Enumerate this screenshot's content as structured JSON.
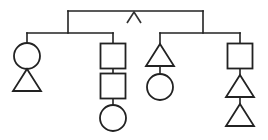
{
  "diagram": {
    "type": "pedigree-chart",
    "background_color": "#ffffff",
    "stroke_color": "#222222",
    "shape_fill": "#ffffff",
    "canvas": {
      "width": 268,
      "height": 140
    },
    "marker": {
      "name": "caret-mark",
      "glyph": "^",
      "x": 134,
      "y": 20,
      "description": "caret pointing up, hanging below top connector bar"
    },
    "connectors": [
      {
        "name": "top-sibling-bar",
        "type": "horizontal",
        "x1": 68,
        "x2": 203,
        "y": 11
      },
      {
        "name": "top-left-drop",
        "type": "vertical",
        "x": 68,
        "y1": 11,
        "y2": 33
      },
      {
        "name": "top-right-drop",
        "type": "vertical",
        "x": 203,
        "y1": 11,
        "y2": 33
      },
      {
        "name": "left-sibling-bar",
        "type": "horizontal",
        "x1": 27,
        "x2": 113,
        "y": 33
      },
      {
        "name": "left-branch-drop-a",
        "type": "vertical",
        "x": 27,
        "y1": 33,
        "y2": 43
      },
      {
        "name": "left-branch-drop-b",
        "type": "vertical",
        "x": 113,
        "y1": 33,
        "y2": 43
      },
      {
        "name": "right-sibling-bar",
        "type": "horizontal",
        "x1": 160,
        "x2": 240,
        "y": 33
      },
      {
        "name": "right-branch-drop-a",
        "type": "vertical",
        "x": 160,
        "y1": 33,
        "y2": 44
      },
      {
        "name": "right-branch-drop-b",
        "type": "vertical",
        "x": 240,
        "y1": 33,
        "y2": 43
      }
    ],
    "branches": [
      {
        "name": "branch-1",
        "center_x": 27,
        "nodes": [
          {
            "name": "circle-node",
            "shape": "circle",
            "cx": 27,
            "cy": 56,
            "r": 13
          },
          {
            "name": "triangle-node",
            "shape": "triangle",
            "cx": 27,
            "top_y": 69,
            "bottom_y": 91,
            "half_width": 14
          }
        ]
      },
      {
        "name": "branch-2",
        "center_x": 113,
        "nodes": [
          {
            "name": "square-node-upper",
            "shape": "square",
            "cx": 113,
            "cy": 56,
            "size": 25
          },
          {
            "name": "square-node-lower",
            "shape": "square",
            "cx": 113,
            "cy": 86,
            "size": 25
          },
          {
            "name": "circle-node",
            "shape": "circle",
            "cx": 113,
            "cy": 118,
            "r": 13
          }
        ],
        "links": [
          {
            "name": "link-square-to-square",
            "x": 113,
            "y1": 68,
            "y2": 74
          },
          {
            "name": "link-square-to-circle",
            "x": 113,
            "y1": 98,
            "y2": 105
          }
        ]
      },
      {
        "name": "branch-3",
        "center_x": 160,
        "nodes": [
          {
            "name": "triangle-node",
            "shape": "triangle",
            "cx": 160,
            "top_y": 44,
            "bottom_y": 66,
            "half_width": 14
          },
          {
            "name": "circle-node",
            "shape": "circle",
            "cx": 160,
            "cy": 87,
            "r": 13
          }
        ],
        "links": [
          {
            "name": "link-triangle-to-circle",
            "x": 160,
            "y1": 66,
            "y2": 74
          }
        ]
      },
      {
        "name": "branch-4",
        "center_x": 240,
        "nodes": [
          {
            "name": "square-node",
            "shape": "square",
            "cx": 240,
            "cy": 56,
            "size": 25
          },
          {
            "name": "triangle-node-upper",
            "shape": "triangle",
            "cx": 240,
            "top_y": 75,
            "bottom_y": 97,
            "half_width": 14
          },
          {
            "name": "triangle-node-lower",
            "shape": "triangle",
            "cx": 240,
            "top_y": 104,
            "bottom_y": 126,
            "half_width": 14
          }
        ],
        "links": [
          {
            "name": "link-square-to-triangle",
            "x": 240,
            "y1": 68,
            "y2": 75
          },
          {
            "name": "link-triangle-to-triangle",
            "x": 240,
            "y1": 97,
            "y2": 104
          }
        ]
      }
    ]
  }
}
